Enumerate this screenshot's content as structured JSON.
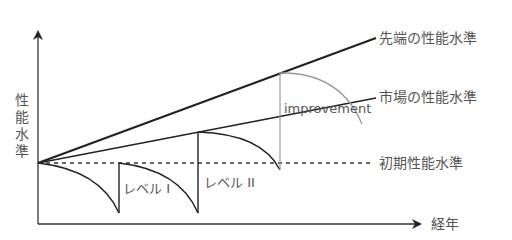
{
  "diagram": {
    "y_axis_label": "性能水準",
    "y_axis_chars": [
      "性",
      "能",
      "水",
      "準"
    ],
    "x_axis_label": "経年",
    "lines": {
      "cutting_edge": "先端の性能水準",
      "market": "市場の性能水準",
      "initial": "初期性能水準"
    },
    "annotations": {
      "level1": "レベル I",
      "level2": "レベル II",
      "improvement": "improvement"
    },
    "colors": {
      "line": "#222222",
      "gray_arc": "#999999",
      "text": "#555555"
    }
  }
}
